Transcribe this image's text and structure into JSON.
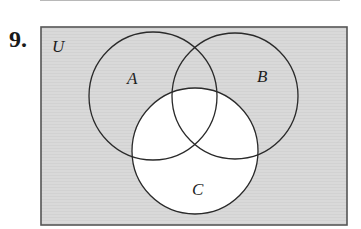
{
  "problem": {
    "number": "9."
  },
  "diagram": {
    "universe": {
      "label": "U",
      "x": 41,
      "y": 27,
      "width": 306,
      "height": 198
    },
    "sets": [
      {
        "label": "A",
        "cx": 153,
        "cy": 96,
        "r": 64,
        "label_x": 133,
        "label_y": 84
      },
      {
        "label": "B",
        "cx": 235,
        "cy": 96,
        "r": 63,
        "label_x": 262,
        "label_y": 82
      },
      {
        "label": "C",
        "cx": 195,
        "cy": 151,
        "r": 63,
        "label_x": 197,
        "label_y": 195
      }
    ],
    "shaded_region": "C'",
    "colors": {
      "shade": "#d9d9d9",
      "unshaded": "#ffffff",
      "stroke": "#2a2a2a",
      "border": "#555555"
    }
  }
}
